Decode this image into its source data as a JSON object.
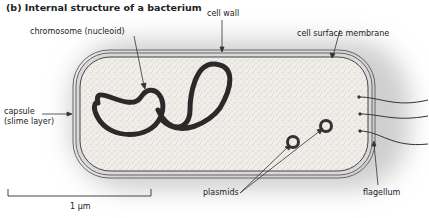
{
  "title": "(b) Internal structure of a bacterium",
  "labels": {
    "cell_wall": "cell wall",
    "chromosome": "chromosome (nucleoid)",
    "cell_surface_membrane": "cell surface membrane",
    "capsule_line1": "capsule",
    "capsule_line2": "(slime layer)",
    "plasmids": "plasmids",
    "flagellum": "flagellum",
    "scale_bar": "1 µm"
  },
  "colors": {
    "cytoplasm": "#ece9e4",
    "halo": "#d6d6d6",
    "outline": "#555555",
    "chromosome": "#2a2a2a"
  }
}
